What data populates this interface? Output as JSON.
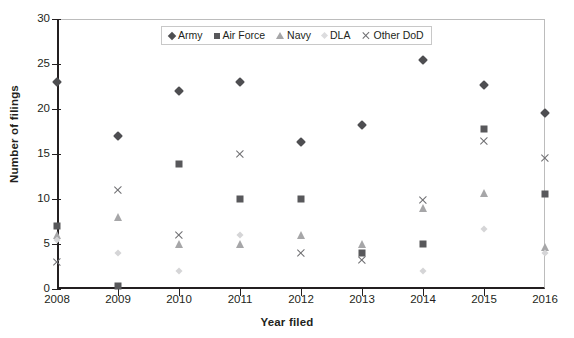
{
  "chart_data": {
    "type": "scatter",
    "title": "",
    "xlabel": "Year filed",
    "ylabel": "Number of filings",
    "categories": [
      "2008",
      "2009",
      "2010",
      "2011",
      "2012",
      "2013",
      "2014",
      "2015",
      "2016"
    ],
    "x": [
      2008,
      2009,
      2010,
      2011,
      2012,
      2013,
      2014,
      2015,
      2016
    ],
    "ylim": [
      0,
      30
    ],
    "yticks": [
      "0",
      "5",
      "10",
      "15",
      "20",
      "25",
      "30"
    ],
    "grid": false,
    "legend_position": "top-center",
    "series": [
      {
        "name": "Army",
        "marker": "diamond",
        "color": "#4e4e51",
        "values": [
          23,
          17,
          22,
          23,
          16.3,
          18.2,
          25.5,
          22.7,
          19.6
        ]
      },
      {
        "name": "Air Force",
        "marker": "square",
        "color": "#58585b",
        "values": [
          7,
          0.3,
          13.9,
          10,
          10,
          4,
          5,
          17.8,
          10.6
        ]
      },
      {
        "name": "Navy",
        "marker": "triangle",
        "color": "#a6a6a8",
        "values": [
          6,
          8,
          5,
          5,
          6,
          5,
          9,
          10.7,
          4.7
        ]
      },
      {
        "name": "DLA",
        "marker": "small-diamond",
        "color": "#d5d5d7",
        "values": [
          5.4,
          4,
          2,
          6,
          null,
          null,
          2,
          6.7,
          4
        ]
      },
      {
        "name": "Other DoD",
        "marker": "x",
        "color": "#6d6d70",
        "values": [
          3,
          11,
          6,
          15,
          4,
          3.2,
          9.9,
          16.5,
          14.6
        ]
      }
    ]
  },
  "legend": {
    "items": [
      {
        "label": "Army",
        "icon": "diamond-marker-icon"
      },
      {
        "label": "Air Force",
        "icon": "square-marker-icon"
      },
      {
        "label": "Navy",
        "icon": "triangle-marker-icon"
      },
      {
        "label": "DLA",
        "icon": "small-diamond-marker-icon"
      },
      {
        "label": "Other DoD",
        "icon": "x-marker-icon"
      }
    ]
  },
  "axes": {
    "y_title": "Number of filings",
    "x_title": "Year filed"
  }
}
